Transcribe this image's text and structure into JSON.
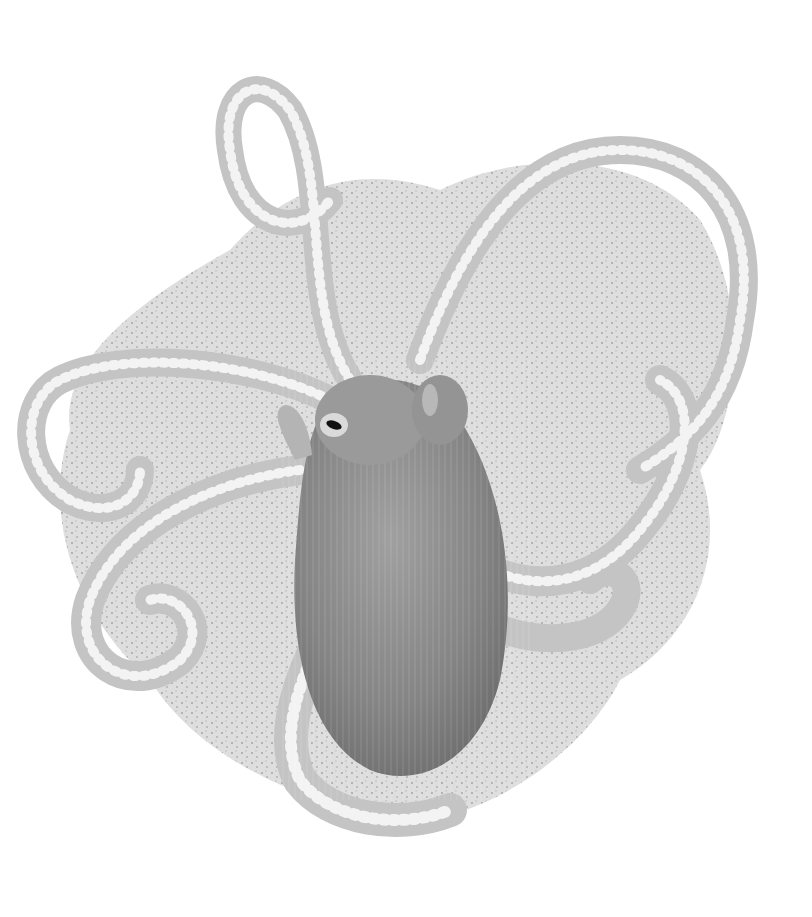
{
  "image": {
    "subject": "octopus",
    "description": "Grayscale photograph of a small octopus with a translucent speckled web spread between curling arms, on a white background",
    "background_color": "#ffffff",
    "colors": {
      "web": "#d8d8d8",
      "web_speckle": "#9a9a9a",
      "arm": "#c4c4c4",
      "arm_edge": "#a8a8a8",
      "sucker": "#e2e2e2",
      "mantle": "#8a8a8a",
      "mantle_dark": "#6e6e6e",
      "head": "#9c9c9c",
      "eye": "#111111"
    }
  }
}
